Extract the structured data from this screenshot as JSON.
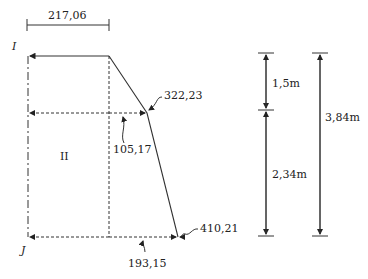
{
  "diagram": {
    "type": "pressure-distribution",
    "top_dimension": "217,06",
    "point_labels": {
      "top": "I",
      "bottom": "J"
    },
    "region_label": "II",
    "values": {
      "mid_right": "322,23",
      "mid_inner": "105,17",
      "bottom_right": "410,21",
      "bottom_inner": "193,15"
    },
    "heights": {
      "upper": "1,5m",
      "lower": "2,34m",
      "total": "3,84m"
    }
  }
}
